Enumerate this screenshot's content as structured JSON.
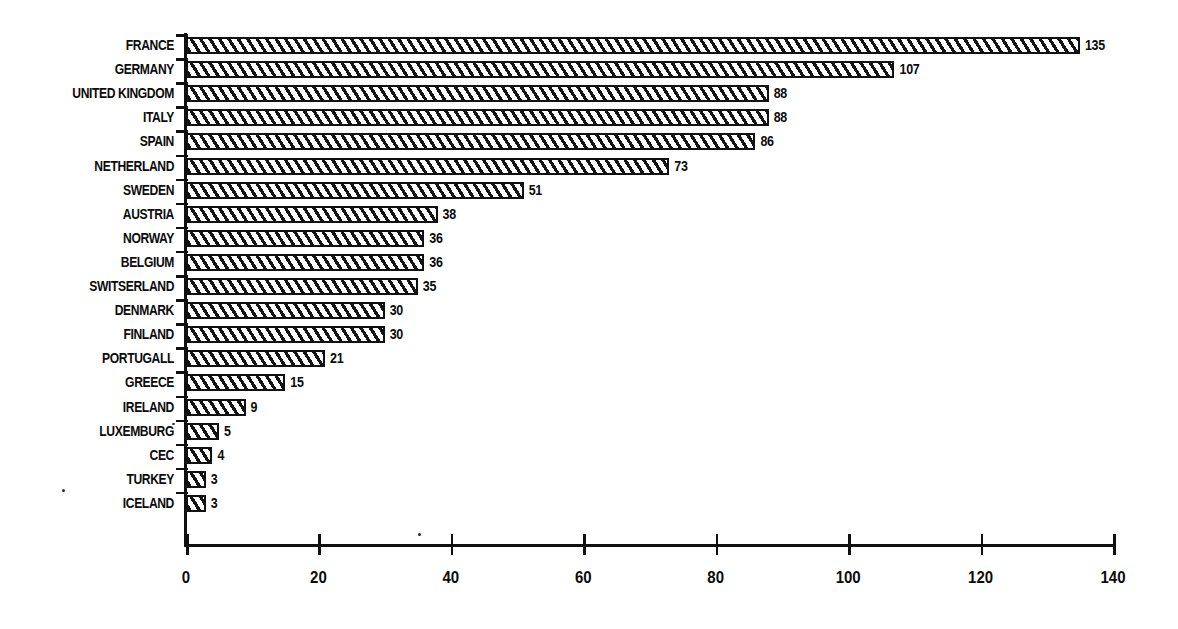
{
  "chart_data": {
    "type": "bar",
    "orientation": "horizontal",
    "title": "",
    "subtitle": "",
    "xlabel": "",
    "ylabel": "",
    "xlim": [
      0,
      140
    ],
    "xticks": [
      0,
      20,
      40,
      60,
      80,
      100,
      120,
      140
    ],
    "xtick_labels": [
      "0",
      "20",
      "40",
      "60",
      "80",
      "100",
      "120",
      "140"
    ],
    "grid": false,
    "legend": null,
    "bar_fill": "diagonal-hatch",
    "value_labels_shown": true,
    "categories": [
      "FRANCE",
      "GERMANY",
      "UNITED KINGDOM",
      "ITALY",
      "SPAIN",
      "NETHERLAND",
      "SWEDEN",
      "AUSTRIA",
      "NORWAY",
      "BELGIUM",
      "SWITSERLAND",
      "DENMARK",
      "FINLAND",
      "PORTUGALL",
      "GREECE",
      "IRELAND",
      "LUXEMBURG",
      "CEC",
      "TURKEY",
      "ICELAND"
    ],
    "values": [
      135,
      107,
      88,
      88,
      86,
      73,
      51,
      38,
      36,
      36,
      35,
      30,
      30,
      21,
      15,
      9,
      5,
      4,
      3,
      3
    ],
    "value_label_texts": [
      "135",
      "107",
      "88",
      "88",
      "86",
      "73",
      "51",
      "38",
      "36",
      "36",
      "35",
      "30",
      "30",
      "21",
      "15",
      "9",
      "5",
      "4",
      "3",
      "3"
    ]
  },
  "colors": {
    "ink": "#101010",
    "paper": "#ffffff",
    "hatch": "#141414"
  }
}
